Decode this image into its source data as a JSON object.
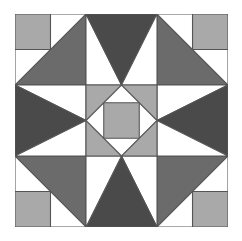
{
  "diagram": {
    "type": "quilt-block",
    "grid_units": 6,
    "colors": {
      "white": "#ffffff",
      "light": "#a9a9a9",
      "medium": "#6b6b6b",
      "dark": "#4a4a4a",
      "line": "#555555"
    },
    "pieces": [
      {
        "name": "background",
        "fill": "white",
        "points": "0,0 6,0 6,6 0,6"
      },
      {
        "name": "corner-square-top-left",
        "fill": "light",
        "points": "0,0 1,0 1,1 0,1"
      },
      {
        "name": "corner-square-top-right",
        "fill": "light",
        "points": "5,0 6,0 6,1 5,1"
      },
      {
        "name": "corner-square-bottom-right",
        "fill": "light",
        "points": "5,5 6,5 6,6 5,6"
      },
      {
        "name": "corner-square-bottom-left",
        "fill": "light",
        "points": "0,5 1,5 1,6 0,6"
      },
      {
        "name": "white-rect-top-left-a",
        "fill": "white",
        "points": "1,0 2,0 2,1 1,1"
      },
      {
        "name": "white-rect-top-left-b",
        "fill": "white",
        "points": "0,1 1,1 1,2 0,2"
      },
      {
        "name": "white-rect-top-right-a",
        "fill": "white",
        "points": "4,0 5,0 5,1 4,1"
      },
      {
        "name": "white-rect-top-right-b",
        "fill": "white",
        "points": "5,1 6,1 6,2 5,2"
      },
      {
        "name": "white-rect-bottom-right-a",
        "fill": "white",
        "points": "5,4 6,4 6,5 5,5"
      },
      {
        "name": "white-rect-bottom-right-b",
        "fill": "white",
        "points": "4,5 5,5 5,6 4,6"
      },
      {
        "name": "white-rect-bottom-left-a",
        "fill": "white",
        "points": "0,4 1,4 1,5 0,5"
      },
      {
        "name": "white-rect-bottom-left-b",
        "fill": "white",
        "points": "1,5 2,5 2,6 1,6"
      },
      {
        "name": "medium-triangle-top-left",
        "fill": "medium",
        "points": "0,2 2,0 2,2"
      },
      {
        "name": "medium-triangle-top-right",
        "fill": "medium",
        "points": "4,0 6,2 4,2"
      },
      {
        "name": "medium-triangle-bottom-right",
        "fill": "medium",
        "points": "6,4 4,6 4,4"
      },
      {
        "name": "medium-triangle-bottom-left",
        "fill": "medium",
        "points": "0,4 2,4 2,6"
      },
      {
        "name": "white-triangle-top-a",
        "fill": "white",
        "points": "2,0 3,2 2,2"
      },
      {
        "name": "dark-triangle-top",
        "fill": "dark",
        "points": "2,0 4,0 3,2"
      },
      {
        "name": "white-triangle-top-b",
        "fill": "white",
        "points": "4,0 4,2 3,2"
      },
      {
        "name": "white-triangle-right-a",
        "fill": "white",
        "points": "6,2 4,3 4,2"
      },
      {
        "name": "dark-triangle-right",
        "fill": "dark",
        "points": "6,2 6,4 4,3"
      },
      {
        "name": "white-triangle-right-b",
        "fill": "white",
        "points": "6,4 4,4 4,3"
      },
      {
        "name": "white-triangle-bottom-a",
        "fill": "white",
        "points": "4,6 3,4 4,4"
      },
      {
        "name": "dark-triangle-bottom",
        "fill": "dark",
        "points": "2,6 4,6 3,4"
      },
      {
        "name": "white-triangle-bottom-b",
        "fill": "white",
        "points": "2,6 2,4 3,4"
      },
      {
        "name": "white-triangle-left-a",
        "fill": "white",
        "points": "0,2 2,2 2,3"
      },
      {
        "name": "dark-triangle-left",
        "fill": "dark",
        "points": "0,2 2,3 0,4"
      },
      {
        "name": "white-triangle-left-b",
        "fill": "white",
        "points": "0,4 2,3 2,4"
      },
      {
        "name": "center-light-square",
        "fill": "light",
        "points": "2,2 4,2 4,4 2,4"
      },
      {
        "name": "center-white-diamond",
        "fill": "white",
        "points": "3,2 4,3 3,4 2,3"
      },
      {
        "name": "center-inner-square",
        "fill": "light",
        "points": "2.5,2.5 3.5,2.5 3.5,3.5 2.5,3.5"
      }
    ]
  }
}
